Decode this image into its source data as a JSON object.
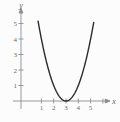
{
  "figure": {
    "background_color": "#fcfcfc",
    "axis_color": "#8f8f8f",
    "tick_label_color": "#6a6a6a",
    "curve_color": "#2b2b2b"
  },
  "chart_data": {
    "type": "line",
    "title": "",
    "xlabel": "x",
    "ylabel": "y",
    "x_ticks": [
      "1",
      "2",
      "3",
      "4",
      "5"
    ],
    "x_tick_values": [
      1,
      2,
      3,
      4,
      5
    ],
    "x_extra_unlabeled_tick_values": [
      6
    ],
    "y_ticks": [
      "1",
      "2",
      "3",
      "4",
      "5"
    ],
    "y_tick_values": [
      1,
      2,
      3,
      4,
      5
    ],
    "xlim": [
      -0.7,
      7.6
    ],
    "ylim": [
      -1.4,
      6.5
    ],
    "grid": false,
    "legend": false,
    "series": [
      {
        "name": "parabola",
        "equation_read_from_graph": "y = (x - 3)^2",
        "vertex": [
          3,
          0
        ],
        "a": 1,
        "x_drawn_range": [
          0.73,
          5.27
        ],
        "points": [
          [
            1,
            4
          ],
          [
            1.5,
            2.25
          ],
          [
            2,
            1
          ],
          [
            2.5,
            0.25
          ],
          [
            3,
            0
          ],
          [
            3.5,
            0.25
          ],
          [
            4,
            1
          ],
          [
            4.5,
            2.25
          ],
          [
            5,
            4
          ]
        ]
      }
    ]
  }
}
